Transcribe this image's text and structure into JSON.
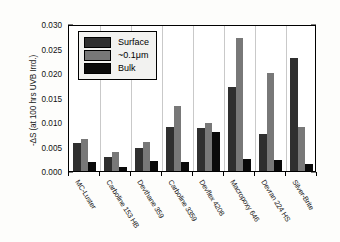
{
  "chart_data": {
    "type": "bar",
    "title": "",
    "xlabel": "",
    "ylabel": "-ΔS (at 100 hrs UVB Irrd.)",
    "ylim": [
      0.0,
      0.03
    ],
    "ytick_labels": [
      "0.000",
      "0.005",
      "0.010",
      "0.015",
      "0.020",
      "0.025",
      "0.030"
    ],
    "ytick_values": [
      0.0,
      0.005,
      0.01,
      0.015,
      0.02,
      0.025,
      0.03
    ],
    "grid": "vertical",
    "legend_position": "upper-left-inside",
    "categories": [
      "MC-Luster",
      "Carboline 153 HB",
      "Devthane 359",
      "Carboline 3359",
      "Devflex 4208",
      "Macropoxy 646",
      "Devran 224 HS",
      "Silver-Brite"
    ],
    "series": [
      {
        "name": "Surface",
        "color": "#2f2f2f",
        "values": [
          0.0058,
          0.0029,
          0.0047,
          0.009,
          0.0087,
          0.0172,
          0.0076,
          0.023
        ]
      },
      {
        "name": "~0.1μm",
        "color": "#787878",
        "values": [
          0.0066,
          0.0038,
          0.006,
          0.0133,
          0.0098,
          0.0272,
          0.02,
          0.009
        ]
      },
      {
        "name": "Bulk",
        "color": "#0a0a0a",
        "values": [
          0.0018,
          0.0008,
          0.002,
          0.0018,
          0.008,
          0.0024,
          0.0023,
          0.0015
        ]
      }
    ]
  }
}
